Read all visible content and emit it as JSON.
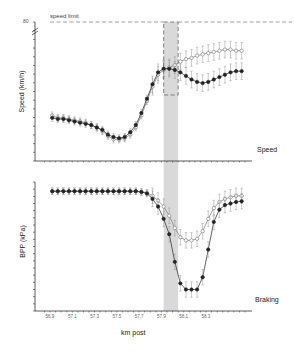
{
  "chart_data": [
    {
      "type": "line",
      "panel_label": "Speed",
      "ylabel": "Speed (km/h)",
      "xlabel": "km post",
      "y_top_tick_label": "80",
      "annotation": "speed limit",
      "speed_limit_kmh": 80,
      "highlight_region_km": [
        57.92,
        58.05
      ],
      "zoom_box_km": [
        57.92,
        58.05
      ],
      "grid": false,
      "x": [
        56.92,
        56.97,
        57.02,
        57.07,
        57.12,
        57.17,
        57.22,
        57.27,
        57.32,
        57.37,
        57.42,
        57.47,
        57.52,
        57.57,
        57.62,
        57.67,
        57.72,
        57.77,
        57.82,
        57.87,
        57.92,
        57.97,
        58.02,
        58.07,
        58.12,
        58.17,
        58.22,
        58.27,
        58.32,
        58.37,
        58.42,
        58.47,
        58.52,
        58.57,
        58.62
      ],
      "series": [
        {
          "name": "open markers",
          "marker": "open-circle",
          "values": [
            41,
            40,
            40,
            39.5,
            39,
            38.5,
            38,
            37,
            36,
            34.5,
            32.5,
            31,
            31,
            31.5,
            33,
            36,
            41,
            47,
            53,
            58,
            60,
            61,
            62,
            63.5,
            64.5,
            65,
            66,
            66.5,
            67,
            67.5,
            68,
            68.5,
            68.5,
            68,
            68
          ]
        },
        {
          "name": "filled markers",
          "marker": "filled-circle",
          "values": [
            40,
            39.5,
            39.5,
            39,
            38.5,
            38,
            37.5,
            37,
            36,
            35,
            33,
            32,
            31.5,
            32,
            34,
            37,
            42,
            48,
            54,
            59,
            60.5,
            60.5,
            60,
            59,
            57.5,
            56,
            55,
            54.5,
            55,
            56,
            57,
            58,
            59,
            59.5,
            59.5
          ]
        }
      ]
    },
    {
      "type": "line",
      "panel_label": "Braking",
      "ylabel": "BPP (kPa)",
      "xlabel": "km post",
      "highlight_region_km": [
        57.92,
        58.05
      ],
      "grid": false,
      "x": [
        56.92,
        56.97,
        57.02,
        57.07,
        57.12,
        57.17,
        57.22,
        57.27,
        57.32,
        57.37,
        57.42,
        57.47,
        57.52,
        57.57,
        57.62,
        57.67,
        57.72,
        57.77,
        57.82,
        57.87,
        57.92,
        57.97,
        58.02,
        58.07,
        58.12,
        58.17,
        58.22,
        58.27,
        58.32,
        58.37,
        58.42,
        58.47,
        58.52,
        58.57,
        58.62
      ],
      "series": [
        {
          "name": "open markers",
          "marker": "open-circle",
          "values": [
            98,
            98,
            98,
            98,
            98,
            98,
            98,
            98,
            98,
            98,
            98,
            98,
            98,
            98,
            98,
            98,
            97.5,
            97,
            95,
            92,
            88,
            82,
            74,
            68,
            66,
            66,
            67,
            72,
            80,
            87,
            91,
            93,
            94,
            95,
            95
          ]
        },
        {
          "name": "filled markers",
          "marker": "filled-circle",
          "values": [
            98,
            98,
            98,
            98,
            98,
            98,
            98,
            98,
            98,
            98,
            98,
            98,
            98,
            98,
            98,
            98,
            97.5,
            96.5,
            93,
            88,
            80,
            70,
            52,
            38,
            34,
            34,
            34,
            42,
            60,
            78,
            86,
            89,
            90,
            91,
            91.5
          ]
        }
      ]
    }
  ],
  "x_tick_labels": [
    "56.9",
    "57.1",
    "57.3",
    "57.5",
    "57.7",
    "57.9",
    "58.1",
    "58.3"
  ],
  "labels": {
    "speed_panel": "Speed",
    "braking_panel": "Braking",
    "speed_ylabel": "Speed (km/h)",
    "bpp_ylabel": "BPP (kPa)",
    "xlabel": "km post",
    "speed_limit": "speed limit",
    "speed_top_tick": "80"
  },
  "colors": {
    "axis": "#333333",
    "shade": "#d9d9d9",
    "open_marker": "#777777",
    "filled_marker": "#222222",
    "dash": "#888888"
  }
}
